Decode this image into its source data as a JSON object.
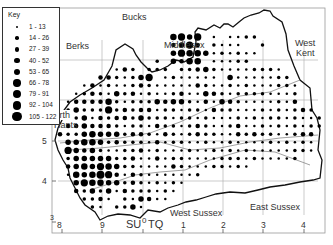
{
  "key": {
    "title": "Key",
    "classes": [
      {
        "label": "1 - 13",
        "size": 2.5
      },
      {
        "label": "14 - 26",
        "size": 3.5
      },
      {
        "label": "27 - 39",
        "size": 4.5
      },
      {
        "label": "40 - 52",
        "size": 5.5
      },
      {
        "label": "53 - 65",
        "size": 6.5
      },
      {
        "label": "66 - 78",
        "size": 7.3
      },
      {
        "label": "79 - 91",
        "size": 8
      },
      {
        "label": "92 - 104",
        "size": 8.8
      },
      {
        "label": "105 - 122",
        "size": 9.6
      }
    ]
  },
  "regions": {
    "bucks": "Bucks",
    "berks": "Berks",
    "middlesex": "Middlesex",
    "west_kent_1": "West",
    "west_kent_2": "Kent",
    "north_hants_1": "North",
    "north_hants_2": "Hants",
    "west_sussex": "West Sussex",
    "east_sussex": "East Sussex"
  },
  "axes": {
    "x_ticks": [
      "8",
      "9",
      "SU",
      "0",
      "TQ",
      "1",
      "2",
      "3",
      "4"
    ],
    "y_ticks": [
      "5",
      "4",
      "3"
    ]
  },
  "map": {
    "frame": {
      "x": 52,
      "y": 8,
      "w": 273,
      "h": 225
    },
    "grid_spacing": 8.1,
    "origin_x": 60,
    "origin_y": 37,
    "dot_rows": [
      {
        "row": 0,
        "start": 14,
        "sizes": "5646.1.1122"
      },
      {
        "row": 1,
        "start": 14,
        "sizes": "3463.2111..2"
      },
      {
        "row": 2,
        "start": 14,
        "sizes": "46554121211"
      },
      {
        "row": 3,
        "start": 12,
        "sizes": "2.4355.11122"
      },
      {
        "row": 4,
        "start": 7,
        "sizes": "132.222.2234211112221"
      },
      {
        "row": 5,
        "start": 5,
        "sizes": "3321246.1211111.41111122"
      },
      {
        "row": 6,
        "start": 3,
        "sizes": "131211232111113211212111221"
      },
      {
        "row": 7,
        "start": 2,
        "sizes": "1232142312112311432122221112"
      },
      {
        "row": 8,
        "start": 1,
        "sizes": "13333521222434421314321111213"
      },
      {
        "row": 9,
        "start": 1,
        "sizes": "2422262323312212213221112121232"
      },
      {
        "row": 10,
        "start": 1,
        "sizes": "22413233242221221211121212212112"
      },
      {
        "row": 11,
        "start": 1,
        "sizes": "33433321221322123211231121212122"
      },
      {
        "row": 12,
        "start": 0,
        "sizes": "32245444233213212322113232211233"
      },
      {
        "row": 13,
        "start": 1,
        "sizes": "4455423222131221121121111212121"
      },
      {
        "row": 14,
        "start": 1,
        "sizes": "6434211223121112112121211111221"
      },
      {
        "row": 15,
        "start": 1,
        "sizes": "24444422311312211112221211112"
      },
      {
        "row": 16,
        "start": 1,
        "sizes": "34546542211113211122121"
      },
      {
        "row": 17,
        "start": 1,
        "sizes": "15457631321111112"
      },
      {
        "row": 18,
        "start": 2,
        "sizes": "46554423212121"
      },
      {
        "row": 19,
        "start": 2,
        "sizes": "3242413222121"
      },
      {
        "row": 20,
        "start": 3,
        "sizes": "2231.214311"
      },
      {
        "row": 21,
        "start": 4,
        "sizes": "21.2241"
      }
    ]
  }
}
